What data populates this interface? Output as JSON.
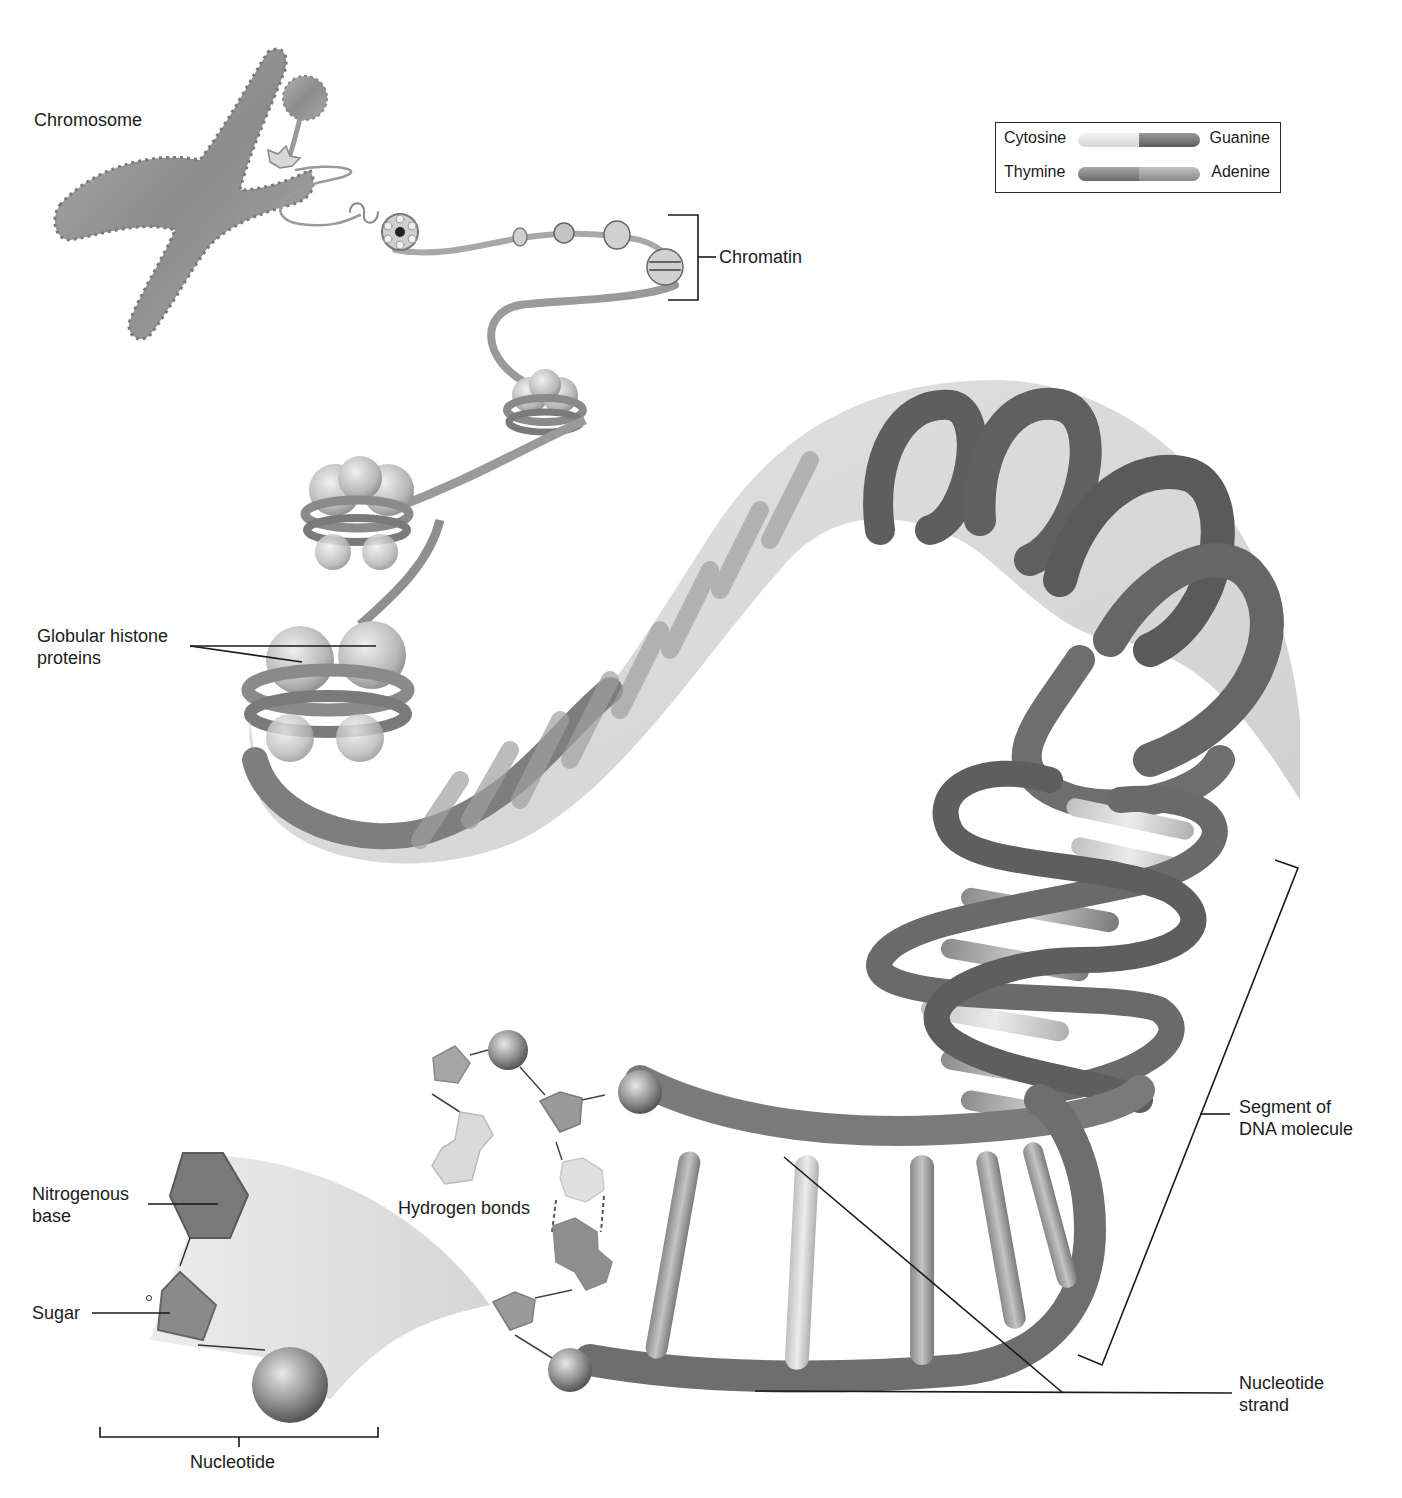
{
  "figure": {
    "colors": {
      "background": "#ffffff",
      "label_text": "#1c1c1c",
      "leader_line": "#1a1a1a",
      "dna_strand_dark": "#5a5a5a",
      "dna_strand_mid": "#8a8a8a",
      "dna_strand_light": "#bdbdbd",
      "halo": "#d0d0d0",
      "histone": "#c8c8c8",
      "cytosine": "#e2e2e2",
      "guanine": "#7a7a7a",
      "thymine": "#8c8c8c",
      "adenine": "#a4a4a4"
    }
  },
  "legend": {
    "rows": [
      {
        "left": "Cytosine",
        "right": "Guanine",
        "left_color": "#e0e0e0",
        "right_color": "#7c7c7c"
      },
      {
        "left": "Thymine",
        "right": "Adenine",
        "left_color": "#8a8a8a",
        "right_color": "#a8a8a8"
      }
    ]
  },
  "labels": {
    "chromosome": "Chromosome",
    "chromatin": "Chromatin",
    "histone_line1": "Globular histone",
    "histone_line2": "proteins",
    "segment_line1": "Segment of",
    "segment_line2": "DNA molecule",
    "nitrogenous_line1": "Nitrogenous",
    "nitrogenous_line2": "base",
    "sugar": "Sugar",
    "hydrogen_bonds": "Hydrogen bonds",
    "nucleotide": "Nucleotide",
    "nucleotide_strand_line1": "Nucleotide",
    "nucleotide_strand_line2": "strand"
  }
}
